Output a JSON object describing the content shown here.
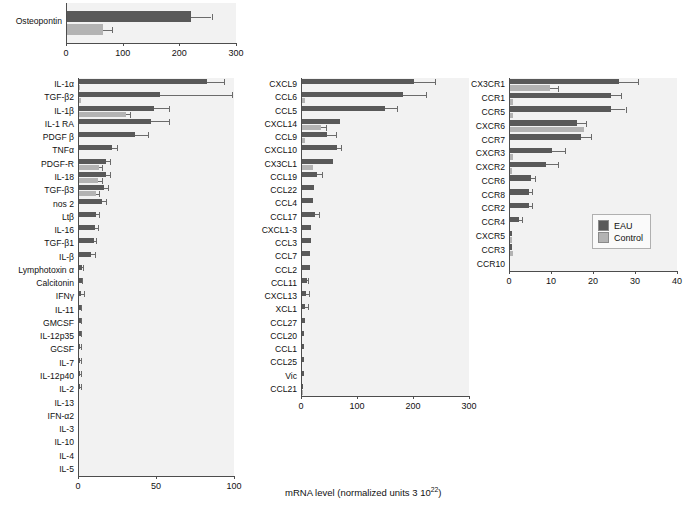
{
  "figure": {
    "x_axis_caption": "mRNA level (normalized units 3 10",
    "x_axis_caption_sup": "22",
    "x_axis_caption_end": ")"
  },
  "legend": {
    "items": [
      {
        "label": "EAU",
        "color": "#595959"
      },
      {
        "label": "Control",
        "color": "#b3b3b3"
      }
    ]
  },
  "chart_data": [
    {
      "type": "bar",
      "id": "osteopontin",
      "orientation": "horizontal",
      "title": "",
      "xlabel": "",
      "ylabel": "",
      "xlim": [
        0,
        300
      ],
      "xticks": [
        0,
        100,
        200,
        300
      ],
      "grid": false,
      "legend_position": "none",
      "categories": [
        "Osteopontin"
      ],
      "series": [
        {
          "name": "EAU",
          "color": "#595959",
          "values": [
            218
          ],
          "errors": [
            37
          ]
        },
        {
          "name": "Control",
          "color": "#b3b3b3",
          "values": [
            63
          ],
          "errors": [
            17
          ]
        }
      ]
    },
    {
      "type": "bar",
      "id": "cytokines",
      "orientation": "horizontal",
      "title": "",
      "xlabel": "",
      "ylabel": "",
      "xlim": [
        0,
        100
      ],
      "xticks": [
        0,
        50,
        100
      ],
      "grid": false,
      "legend_position": "none",
      "categories": [
        "IL-1α",
        "TGF-β2",
        "IL-1β",
        "IL-1 RA",
        "PDGF β",
        "TNFα",
        "PDGF-R",
        "IL-18",
        "TGF-β3",
        "nos 2",
        "Ltβ",
        "IL-16",
        "TGF-β1",
        "IL-β",
        "Lymphotoxin α",
        "Calcitonin",
        "IFNγ",
        "IL-11",
        "GMCSF",
        "IL-12p35",
        "GCSF",
        "IL-7",
        "IL-12p40",
        "IL-2",
        "IL-13",
        "IFN-α2",
        "IL-3",
        "IL-10",
        "IL-4",
        "IL-5"
      ],
      "series": [
        {
          "name": "EAU",
          "color": "#595959",
          "values": [
            82,
            52,
            48,
            46,
            36,
            21,
            17,
            17,
            16,
            15,
            11,
            10,
            9.5,
            7.5,
            2.2,
            1.8,
            1.5,
            1.2,
            1.1,
            1.0,
            0.9,
            0.8,
            0.8,
            0.7,
            0,
            0,
            0,
            0,
            0,
            0
          ],
          "errors": [
            11,
            46,
            10,
            12,
            8,
            3.5,
            3,
            3,
            2.5,
            2.5,
            2,
            2,
            1.5,
            2.5,
            0.5,
            0.4,
            1.5,
            0.3,
            0.3,
            0.3,
            0.2,
            0.2,
            0.2,
            0.2,
            0,
            0,
            0,
            0,
            0,
            0
          ]
        },
        {
          "name": "Control",
          "color": "#b3b3b3",
          "values": [
            0.6,
            1.0,
            30,
            0,
            0,
            0,
            12.5,
            12,
            11,
            0,
            0,
            0,
            0,
            0,
            0,
            0,
            0,
            0,
            0,
            0,
            0,
            0,
            0,
            0,
            0,
            0,
            0,
            0,
            0,
            0
          ],
          "errors": [
            0,
            0,
            3,
            0,
            0,
            0,
            2.5,
            2.5,
            2,
            0,
            0,
            0,
            0,
            0,
            0,
            0,
            0,
            0,
            0,
            0,
            0,
            0,
            0,
            0,
            0,
            0,
            0,
            0,
            0,
            0
          ]
        }
      ]
    },
    {
      "type": "bar",
      "id": "chemokines",
      "orientation": "horizontal",
      "title": "",
      "xlabel": "",
      "ylabel": "",
      "xlim": [
        0,
        300
      ],
      "xticks": [
        0,
        100,
        200,
        300
      ],
      "grid": false,
      "legend_position": "none",
      "categories": [
        "CXCL9",
        "CCL6",
        "CCL5",
        "CXCL14",
        "CCL9",
        "CXCL10",
        "CX3CL1",
        "CCL19",
        "CCL22",
        "CCL4",
        "CCL17",
        "CXCL1-3",
        "CCL3",
        "CCL7",
        "CCL2",
        "CCL11",
        "CXCL13",
        "XCL1",
        "CCL27",
        "CCL20",
        "CCL1",
        "CCL25",
        "Vic",
        "CCL21"
      ],
      "series": [
        {
          "name": "EAU",
          "color": "#595959",
          "values": [
            200,
            180,
            148,
            68,
            45,
            62,
            55,
            26,
            22,
            20,
            24,
            16,
            16,
            15,
            14,
            9,
            7,
            6,
            5,
            4,
            4,
            4,
            3,
            2
          ],
          "errors": [
            38,
            42,
            22,
            0,
            16,
            8,
            0,
            9,
            0,
            0,
            6,
            0,
            0,
            0,
            0,
            2,
            5,
            5,
            0,
            0,
            0,
            0,
            0,
            0
          ]
        },
        {
          "name": "Control",
          "color": "#b3b3b3",
          "values": [
            0,
            6,
            0,
            34,
            5,
            0,
            20,
            0,
            0,
            0,
            0,
            0,
            0,
            0,
            0,
            0,
            0,
            0,
            0,
            0,
            0,
            0,
            0,
            2
          ],
          "errors": [
            0,
            0,
            0,
            9,
            0,
            0,
            0,
            0,
            0,
            0,
            0,
            0,
            0,
            0,
            0,
            0,
            0,
            0,
            0,
            0,
            0,
            0,
            0,
            0
          ]
        }
      ]
    },
    {
      "type": "bar",
      "id": "chemokine-receptors",
      "orientation": "horizontal",
      "title": "",
      "xlabel": "",
      "ylabel": "",
      "xlim": [
        0,
        40
      ],
      "xticks": [
        0,
        10,
        20,
        30,
        40
      ],
      "grid": false,
      "legend_position": "inside-right",
      "categories": [
        "CX3CR1",
        "CCR1",
        "CCR5",
        "CXCR6",
        "CCR7",
        "CXCR3",
        "CXCR2",
        "CCR6",
        "CCR8",
        "CCR2",
        "CCR4",
        "CXCR5",
        "CCR3",
        "CCR10"
      ],
      "series": [
        {
          "name": "EAU",
          "color": "#595959",
          "values": [
            26,
            24,
            24,
            16,
            17,
            10,
            8.5,
            5,
            4.6,
            4.5,
            2.2,
            0.5,
            0.5,
            0
          ],
          "errors": [
            4.5,
            2.5,
            3.5,
            2,
            2.2,
            3,
            3,
            1,
            0.7,
            0.7,
            0.7,
            0,
            0,
            0
          ]
        },
        {
          "name": "Control",
          "color": "#b3b3b3",
          "values": [
            9.5,
            0.8,
            0.8,
            17.5,
            0,
            0.6,
            0.5,
            0,
            0,
            0,
            0,
            0.4,
            0.6,
            0
          ],
          "errors": [
            2,
            0,
            0,
            0,
            0,
            0,
            0,
            0,
            0,
            0,
            0,
            0,
            0,
            0
          ]
        }
      ]
    }
  ]
}
